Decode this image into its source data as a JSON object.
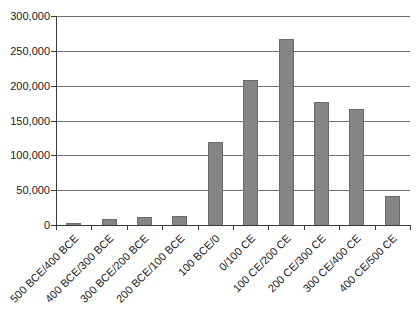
{
  "chart_data": {
    "type": "bar",
    "title": "",
    "xlabel": "",
    "ylabel": "",
    "categories": [
      "500 BCE/400 BCE",
      "400 BCE/300 BCE",
      "300 BCE/200 BCE",
      "200 BCE/100 BCE",
      "100 BCE/0",
      "0/100 CE",
      "100 CE/200 CE",
      "200 CE/300 CE",
      "300 CE/400 CE",
      "400 CE/500 CE"
    ],
    "values": [
      3000,
      8000,
      12000,
      13000,
      119000,
      208000,
      267000,
      177000,
      167000,
      42000
    ],
    "ylim": [
      0,
      300000
    ],
    "ytick_interval": 50000,
    "ytick_labels": [
      "0",
      "50,000",
      "100,000",
      "150,000",
      "200,000",
      "250,000",
      "300,000"
    ],
    "grid": true,
    "legend": false,
    "colors": {
      "bar_fill": "#858585",
      "bar_border": "#6b6b6b",
      "gridline": "#707070",
      "axis": "#3a3a3a",
      "text": "#1a1a1a",
      "background": "#ffffff"
    }
  }
}
